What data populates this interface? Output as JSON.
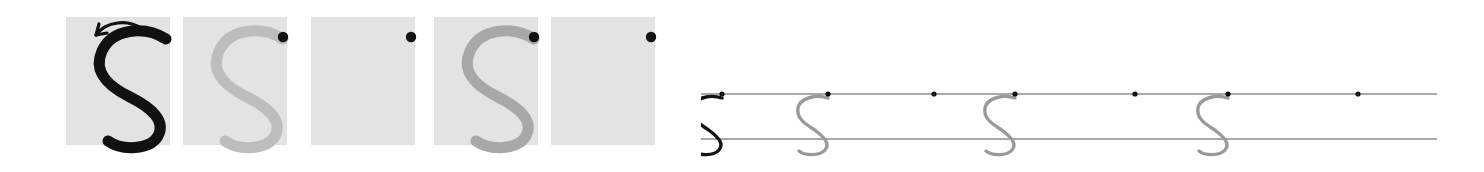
{
  "worksheet": {
    "letter": "S",
    "title": "Letter S handwriting tracing practice row",
    "description": "Five shaded practice squares showing a fading model of the lowercase-style letter S, followed by a two-line ruled writing strip with fading model letters and starting dots.",
    "stroke_count": 1,
    "start_dot_label": "start-dot",
    "direction_arrow_label": "stroke-direction-arrow"
  },
  "colors": {
    "box_fill": "#e3e3e3",
    "ink_black": "#111111",
    "ink_gray_light": "#b9b9b9",
    "ink_gray_medium": "#a6a6a6",
    "ink_gray_rule_letter": "#9a9a9a",
    "rule_line": "#555555",
    "dot": "#111111",
    "page_background": "#ffffff"
  },
  "box_section": {
    "name": "practice-boxes",
    "box_width": 104,
    "box_height": 128,
    "box_top": 17,
    "boxes": [
      {
        "index": 1,
        "x": 66,
        "letter": "S",
        "letter_shade": "black",
        "letter_color": "#111111",
        "has_letter": true,
        "has_dot": false,
        "has_arrow": true,
        "label": "model-letter-box-1"
      },
      {
        "index": 2,
        "x": 183,
        "letter": "S",
        "letter_shade": "light-gray",
        "letter_color": "#bdbdbd",
        "has_letter": true,
        "has_dot": true,
        "has_arrow": false,
        "label": "trace-letter-box-2"
      },
      {
        "index": 3,
        "x": 311,
        "letter": "",
        "letter_shade": "none",
        "letter_color": "#00000000",
        "has_letter": false,
        "has_dot": true,
        "has_arrow": false,
        "label": "blank-practice-box-3"
      },
      {
        "index": 4,
        "x": 434,
        "letter": "S",
        "letter_shade": "medium-gray",
        "letter_color": "#a8a8a8",
        "has_letter": true,
        "has_dot": true,
        "has_arrow": false,
        "label": "trace-letter-box-4"
      },
      {
        "index": 5,
        "x": 551,
        "letter": "",
        "letter_shade": "none",
        "letter_color": "#00000000",
        "has_letter": false,
        "has_dot": true,
        "has_arrow": false,
        "label": "blank-practice-box-5"
      }
    ]
  },
  "rule_section": {
    "name": "ruled-writing-strip",
    "left": 701,
    "right": 1437,
    "top_line_y": 94,
    "bottom_line_y": 139,
    "line_count": 2,
    "items": [
      {
        "index": 1,
        "x": 722,
        "letter": "S",
        "letter_shade": "black",
        "letter_color": "#141414",
        "has_letter": true,
        "has_dot": true,
        "has_arrow": true,
        "label": "rule-model-letter-1"
      },
      {
        "index": 2,
        "x": 828,
        "letter": "S",
        "letter_shade": "gray",
        "letter_color": "#9a9a9a",
        "has_letter": true,
        "has_dot": true,
        "has_arrow": false,
        "label": "rule-trace-letter-2"
      },
      {
        "index": 3,
        "x": 934,
        "letter": "",
        "letter_shade": "none",
        "letter_color": "#00000000",
        "has_letter": false,
        "has_dot": true,
        "has_arrow": false,
        "label": "rule-blank-slot-3"
      },
      {
        "index": 4,
        "x": 1015,
        "letter": "S",
        "letter_shade": "gray",
        "letter_color": "#9a9a9a",
        "has_letter": true,
        "has_dot": true,
        "has_arrow": false,
        "label": "rule-trace-letter-4"
      },
      {
        "index": 5,
        "x": 1135,
        "letter": "",
        "letter_shade": "none",
        "letter_color": "#00000000",
        "has_letter": false,
        "has_dot": true,
        "has_arrow": false,
        "label": "rule-blank-slot-5"
      },
      {
        "index": 6,
        "x": 1228,
        "letter": "S",
        "letter_shade": "gray",
        "letter_color": "#9a9a9a",
        "has_letter": true,
        "has_dot": true,
        "has_arrow": false,
        "label": "rule-trace-letter-6"
      },
      {
        "index": 7,
        "x": 1358,
        "letter": "",
        "letter_shade": "none",
        "letter_color": "#00000000",
        "has_letter": false,
        "has_dot": true,
        "has_arrow": false,
        "label": "rule-blank-slot-7"
      }
    ]
  },
  "glyph_paths": {
    "letter_s_box": "M100 22 C 78 8, 46 12, 36 34 C 26 56, 44 70, 64 80 C 86 91, 100 104, 92 119 C 84 133, 56 134, 42 124",
    "letter_s_rule": "M34 4 C 22 0, 6 4, 4 14 C 2 26, 14 31, 22 37 C 31 44, 36 50, 31 56 C 26 62, 11 62, 5 57",
    "arrow_curve_box": "M76 12 C 62 2, 40 4, 30 18",
    "arrow_head_box": "M30 18 L 41 16 M30 18 L 33 7",
    "arrow_curve_rule": "M26 3 C 18 2, 10 8, 7 17",
    "arrow_head_rule": "M7 17 L 14 14 M7 17 L 11 9"
  }
}
